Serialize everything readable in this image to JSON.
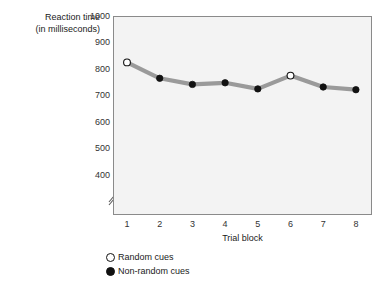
{
  "chart_data": {
    "type": "line",
    "title": "",
    "xlabel": "Trial block",
    "ylabel": "Reaction time (in milliseconds)",
    "ylabel_line1": "Reaction time",
    "ylabel_line2": "(in milliseconds)",
    "categories": [
      "1",
      "2",
      "3",
      "4",
      "5",
      "6",
      "7",
      "8"
    ],
    "x": [
      1,
      2,
      3,
      4,
      5,
      6,
      7,
      8
    ],
    "values": [
      825,
      765,
      742,
      748,
      725,
      775,
      732,
      722
    ],
    "marker_types": [
      "open",
      "filled",
      "filled",
      "filled",
      "filled",
      "open",
      "filled",
      "filled"
    ],
    "yticks": [
      1000,
      900,
      800,
      700,
      600,
      500,
      400
    ],
    "ytick_labels": [
      "1000",
      "900",
      "800",
      "700",
      "600",
      "500",
      "400"
    ],
    "ylim": [
      355,
      1000
    ],
    "xlim": [
      0.55,
      8.45
    ],
    "axis_break": true,
    "grid": false,
    "legend_position": "below-left",
    "legend": [
      {
        "marker": "open",
        "label": "Random cues"
      },
      {
        "marker": "filled",
        "label": "Non-random cues"
      }
    ],
    "colors": {
      "line": "#9a9a9a",
      "marker_fill": "#111111",
      "marker_open_fill": "#ffffff",
      "marker_edge": "#111111",
      "plot_background": "#f3f3f3",
      "frame": "#8a8a8a",
      "text": "#1a1a1a",
      "tick_text": "#333333"
    }
  }
}
